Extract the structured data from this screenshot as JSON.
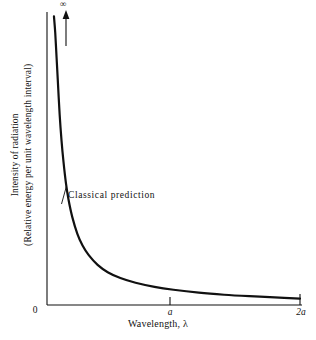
{
  "figure": {
    "background_color": "#ffffff",
    "ink_color": "#111111"
  },
  "chart_data": {
    "type": "line",
    "title": "",
    "subtitle": "",
    "xlabel": "Wavelength, λ",
    "ylabel_line1": "Intensity of radiation",
    "ylabel_line2": "(Relative energy per unit wavelength interval)",
    "xtick_labels": [
      "0",
      "a",
      "2a"
    ],
    "ytick_labels": [
      "0"
    ],
    "x_axis_origin_label": "0",
    "y_axis_top_symbol": "∞",
    "grid": false,
    "legend": false,
    "legend_position": "none",
    "xlim": [
      0,
      2
    ],
    "ylim": [
      0,
      1
    ],
    "annotations": [
      {
        "text": "Classical prediction",
        "x": 0.17,
        "y": 0.38
      }
    ],
    "series": [
      {
        "name": "Classical prediction",
        "description": "Rayleigh-Jeans law: intensity diverges as wavelength approaches zero and decays asymptotically toward zero at long wavelength",
        "color": "#111111",
        "linewidth": 2.2,
        "x": [
          0.055,
          0.065,
          0.075,
          0.085,
          0.1,
          0.115,
          0.13,
          0.15,
          0.17,
          0.2,
          0.24,
          0.28,
          0.33,
          0.4,
          0.48,
          0.58,
          0.7,
          0.85,
          1.0,
          1.2,
          1.4,
          1.6,
          1.8,
          2.0
        ],
        "y": [
          0.985,
          0.93,
          0.85,
          0.77,
          0.65,
          0.56,
          0.49,
          0.415,
          0.36,
          0.3,
          0.243,
          0.204,
          0.17,
          0.137,
          0.112,
          0.092,
          0.076,
          0.062,
          0.052,
          0.042,
          0.035,
          0.03,
          0.026,
          0.022
        ]
      }
    ]
  },
  "axis_arrow": {
    "name": "infinity-arrow",
    "symbol": "∞",
    "direction": "up"
  }
}
